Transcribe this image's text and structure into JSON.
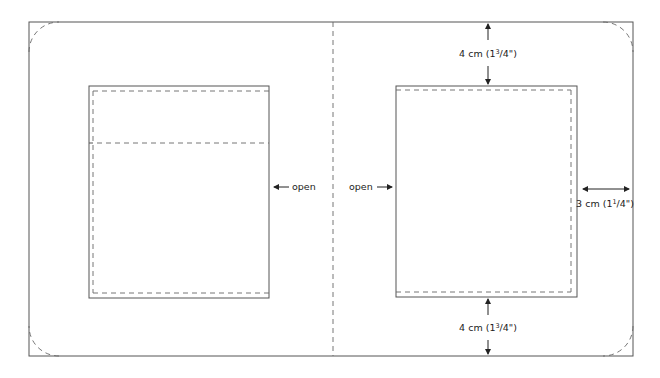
{
  "colors": {
    "line": "#555555",
    "dash": "#666666",
    "text": "#222222",
    "background": "#ffffff"
  },
  "labels": {
    "open_left": "open",
    "open_right": "open",
    "top_margin": {
      "value": "4 cm (1",
      "sup": "3",
      "rest": "/4\")"
    },
    "bottom_margin": {
      "value": "4 cm (1",
      "sup": "3",
      "rest": "/4\")"
    },
    "side_margin": {
      "value": "3 cm (1",
      "sup": "1",
      "rest": "/4\")"
    }
  },
  "shapes": {
    "outer_frame": {
      "x": 29,
      "y": 22,
      "w": 604,
      "h": 334,
      "corner_radius": 30
    },
    "fold_line_x": 333,
    "left_pocket": {
      "x": 89,
      "y": 86,
      "w": 180,
      "h": 212,
      "inner_dash_inset": 5,
      "flap_dash_y": 143
    },
    "right_pocket": {
      "x": 396,
      "y": 86,
      "w": 181,
      "h": 211,
      "inner_dash_inset": 5
    }
  }
}
